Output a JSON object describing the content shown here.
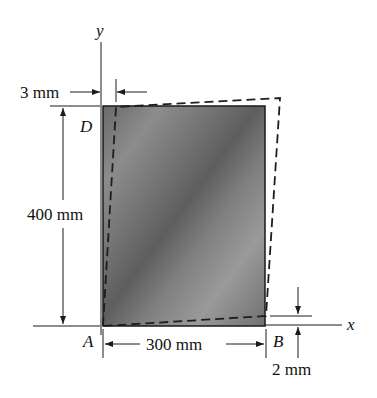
{
  "figure": {
    "type": "deformed-plate-diagram",
    "axes": {
      "x_label": "x",
      "y_label": "y"
    },
    "points": {
      "A": "A",
      "B": "B",
      "D": "D"
    },
    "dimensions": {
      "width_label": "300 mm",
      "height_label": "400 mm",
      "top_shift_label": "3 mm",
      "corner_drop_label": "2 mm"
    },
    "colors": {
      "plate_dark": "#5a5a5a",
      "plate_light": "#9c9c9c",
      "line": "#1a1a1a",
      "dashed": "#222222"
    }
  }
}
